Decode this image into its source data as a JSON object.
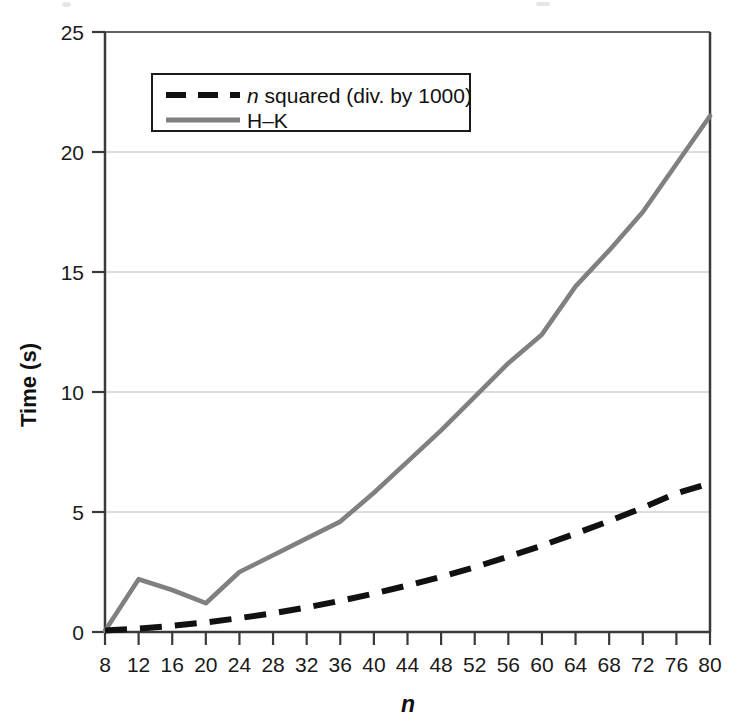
{
  "chart_data": {
    "type": "line",
    "title": "",
    "xlabel": "n",
    "ylabel": "Time (s)",
    "xlim": [
      8,
      80
    ],
    "ylim": [
      0,
      25
    ],
    "grid": true,
    "legend_position": "top-left-inside",
    "x": [
      8,
      12,
      16,
      20,
      24,
      28,
      32,
      36,
      40,
      44,
      48,
      52,
      56,
      60,
      64,
      68,
      72,
      76,
      80
    ],
    "xticks": [
      "8",
      "12",
      "16",
      "20",
      "24",
      "28",
      "32",
      "36",
      "40",
      "44",
      "48",
      "52",
      "56",
      "60",
      "64",
      "68",
      "72",
      "76",
      "80"
    ],
    "yticks": [
      "0",
      "5",
      "10",
      "15",
      "20",
      "25"
    ],
    "ytick_values": [
      0,
      5,
      10,
      15,
      20,
      25
    ],
    "series": [
      {
        "name": "n squared (div. by 1000)",
        "style": "dashed",
        "color": "#111111",
        "values": [
          0.06,
          0.14,
          0.26,
          0.4,
          0.58,
          0.78,
          1.02,
          1.3,
          1.6,
          1.94,
          2.3,
          2.7,
          3.14,
          3.6,
          4.1,
          4.62,
          5.18,
          5.78,
          6.2
        ]
      },
      {
        "name": "H-K",
        "style": "solid",
        "color": "#808080",
        "values": [
          0.05,
          2.2,
          1.75,
          1.2,
          2.5,
          3.2,
          3.9,
          4.6,
          5.8,
          7.1,
          8.4,
          9.8,
          11.2,
          12.4,
          14.4,
          15.9,
          17.5,
          19.5,
          21.5
        ]
      }
    ]
  },
  "legend": {
    "items": [
      {
        "label_italic_prefix": "n",
        "label": " squared (div. by 1000)",
        "marker": "dashed-line-marker"
      },
      {
        "label_italic_prefix": "",
        "label": "H–K",
        "marker": "solid-line-marker"
      }
    ]
  },
  "axes": {
    "y_title": "Time (s)",
    "x_title": "n"
  },
  "colors": {
    "hk_line": "#808080",
    "nsq_line": "#111111",
    "grid": "#b8b8b8",
    "axis": "#3a3a3a",
    "background": "#ffffff"
  }
}
